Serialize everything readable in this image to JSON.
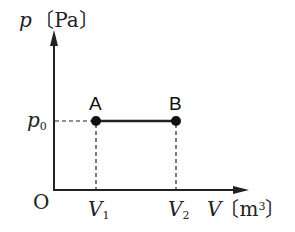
{
  "diagram": {
    "y_axis": {
      "symbol": "p",
      "unit": "〔Pa〕"
    },
    "x_axis": {
      "symbol": "V",
      "unit_prefix": "〔m",
      "unit_exp": "3",
      "unit_suffix": "〕"
    },
    "origin": "O",
    "p_level": {
      "symbol": "p",
      "sub": "0"
    },
    "v_ticks": [
      {
        "symbol": "V",
        "sub": "1"
      },
      {
        "symbol": "V",
        "sub": "2"
      }
    ],
    "points": [
      {
        "label": "A"
      },
      {
        "label": "B"
      }
    ],
    "colors": {
      "line": "#222222",
      "background": "#ffffff"
    }
  }
}
